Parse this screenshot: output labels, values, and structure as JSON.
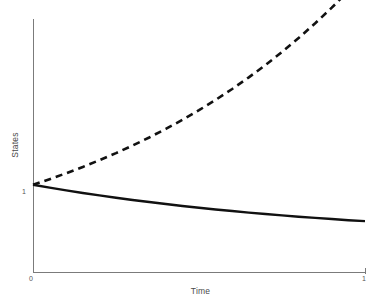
{
  "chart_data": {
    "type": "line",
    "title": "",
    "subtitle": "",
    "xlabel": "Time",
    "ylabel": "States",
    "xlim": [
      0,
      1
    ],
    "ylim": [
      0,
      2.9
    ],
    "grid": false,
    "legend": "none",
    "background_color": "#ffffff",
    "axis_color": "#7b7b7b",
    "series_color": "#111111",
    "x_tick_labels": [
      "0",
      "1"
    ],
    "y_tick_labels": [
      "1"
    ],
    "y_tick_values": [
      1
    ],
    "x_tick_values": [
      0,
      1
    ],
    "annotations": [],
    "x": [
      0,
      0.05,
      0.1,
      0.15,
      0.2,
      0.25,
      0.3,
      0.35,
      0.4,
      0.45,
      0.5,
      0.55,
      0.6,
      0.65,
      0.7,
      0.75,
      0.8,
      0.85,
      0.9,
      0.95,
      1
    ],
    "series": [
      {
        "name": "decaying-state",
        "style": "solid",
        "values": [
          1.0,
          0.967,
          0.936,
          0.906,
          0.878,
          0.851,
          0.826,
          0.802,
          0.779,
          0.757,
          0.737,
          0.717,
          0.699,
          0.681,
          0.665,
          0.649,
          0.634,
          0.62,
          0.607,
          0.594,
          0.583
        ]
      },
      {
        "name": "growing-state",
        "style": "dashed",
        "values": [
          1.0,
          1.064,
          1.132,
          1.204,
          1.281,
          1.363,
          1.45,
          1.542,
          1.64,
          1.744,
          1.855,
          1.973,
          2.098,
          2.231,
          2.372,
          2.522,
          2.681,
          2.851,
          3.03,
          3.221,
          3.424
        ]
      }
    ]
  },
  "plot_geometry": {
    "x_axis_start_px": 33,
    "x_axis_end_px": 366,
    "y_axis_top_px": 19,
    "y_axis_baseline_px": 272,
    "y_one_px": 192
  }
}
